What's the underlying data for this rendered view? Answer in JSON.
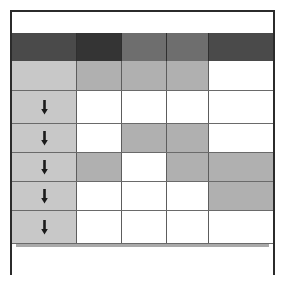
{
  "card": {
    "border_color": "#2b2b2b",
    "background": "#ffffff"
  },
  "title_band": {
    "text": ""
  },
  "palette": {
    "header_dark": "#4a4a4a",
    "header_darkest": "#343434",
    "header_mid": "#6e6e6e",
    "label_column": "#c8c8c8",
    "cell_shaded": "#b0b0b0",
    "cell_empty": "#ffffff",
    "grid_line": "#5d5d5d",
    "row_line": "#6a6a6a"
  },
  "columns": [
    {
      "key": "labels",
      "header": "",
      "x": 0,
      "width": 65,
      "header_color": "#4a4a4a"
    },
    {
      "key": "col1",
      "header": "",
      "x": 65,
      "width": 45,
      "header_color": "#343434"
    },
    {
      "key": "col2",
      "header": "",
      "x": 110,
      "width": 45,
      "header_color": "#6e6e6e"
    },
    {
      "key": "col3",
      "header": "",
      "x": 155,
      "width": 42,
      "header_color": "#6e6e6e"
    },
    {
      "key": "col4",
      "header": "",
      "x": 197,
      "width": 64,
      "header_color": "#4a4a4a"
    }
  ],
  "rows": [
    {
      "label": "",
      "icon": "",
      "y": 28,
      "height": 30,
      "cells": [
        {
          "fill": "#c8c8c8",
          "text": ""
        },
        {
          "fill": "#b0b0b0",
          "text": ""
        },
        {
          "fill": "#b0b0b0",
          "text": ""
        },
        {
          "fill": "#b0b0b0",
          "text": ""
        },
        {
          "fill": "#ffffff",
          "text": ""
        }
      ]
    },
    {
      "label": "",
      "icon": "arrow-down-icon",
      "y": 58,
      "height": 33,
      "cells": [
        {
          "fill": "#c8c8c8",
          "text": ""
        },
        {
          "fill": "#ffffff",
          "text": ""
        },
        {
          "fill": "#ffffff",
          "text": ""
        },
        {
          "fill": "#ffffff",
          "text": ""
        },
        {
          "fill": "#ffffff",
          "text": ""
        }
      ]
    },
    {
      "label": "",
      "icon": "arrow-down-icon",
      "y": 91,
      "height": 29,
      "cells": [
        {
          "fill": "#c8c8c8",
          "text": ""
        },
        {
          "fill": "#ffffff",
          "text": ""
        },
        {
          "fill": "#b0b0b0",
          "text": ""
        },
        {
          "fill": "#b0b0b0",
          "text": ""
        },
        {
          "fill": "#ffffff",
          "text": ""
        }
      ]
    },
    {
      "label": "",
      "icon": "arrow-down-icon",
      "y": 120,
      "height": 29,
      "cells": [
        {
          "fill": "#c8c8c8",
          "text": ""
        },
        {
          "fill": "#b0b0b0",
          "text": ""
        },
        {
          "fill": "#ffffff",
          "text": ""
        },
        {
          "fill": "#b0b0b0",
          "text": ""
        },
        {
          "fill": "#b0b0b0",
          "text": ""
        }
      ]
    },
    {
      "label": "",
      "icon": "arrow-down-icon",
      "y": 149,
      "height": 29,
      "cells": [
        {
          "fill": "#c8c8c8",
          "text": ""
        },
        {
          "fill": "#ffffff",
          "text": ""
        },
        {
          "fill": "#ffffff",
          "text": ""
        },
        {
          "fill": "#ffffff",
          "text": ""
        },
        {
          "fill": "#b0b0b0",
          "text": ""
        }
      ]
    },
    {
      "label": "",
      "icon": "arrow-down-icon",
      "y": 178,
      "height": 33,
      "cells": [
        {
          "fill": "#c8c8c8",
          "text": ""
        },
        {
          "fill": "#ffffff",
          "text": ""
        },
        {
          "fill": "#ffffff",
          "text": ""
        },
        {
          "fill": "#ffffff",
          "text": ""
        },
        {
          "fill": "#ffffff",
          "text": ""
        }
      ]
    }
  ],
  "footer": {
    "text": ""
  }
}
